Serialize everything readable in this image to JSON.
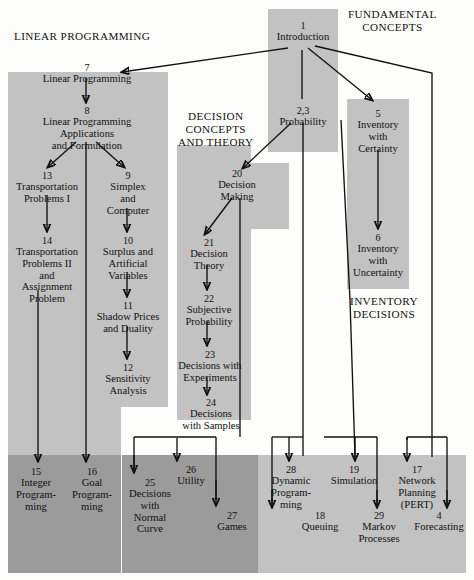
{
  "diagram": {
    "section_labels": [
      {
        "id": "linear-programming",
        "text": "LINEAR PROGRAMMING",
        "x": 14,
        "y": 30
      },
      {
        "id": "fundamental-concepts",
        "text": "FUNDAMENTAL\nCONCEPTS",
        "x": 348,
        "y": 8
      },
      {
        "id": "decision-concepts-and-theory",
        "text": "DECISION\nCONCEPTS\nAND THEORY",
        "x": 178,
        "y": 110
      },
      {
        "id": "inventory-decisions",
        "text": "INVENTORY\nDECISIONS",
        "x": 350,
        "y": 295
      }
    ],
    "panels": [
      {
        "id": "lp-panel-upper",
        "x": 8,
        "y": 72,
        "w": 160,
        "h": 335,
        "shade": "light"
      },
      {
        "id": "lp-panel-lower",
        "x": 8,
        "y": 407,
        "w": 113,
        "h": 48,
        "shade": "light"
      },
      {
        "id": "lp-panel-bottom",
        "x": 8,
        "y": 455,
        "w": 113,
        "h": 118,
        "shade": "dark"
      },
      {
        "id": "intro-panel",
        "x": 268,
        "y": 9,
        "w": 70,
        "h": 143,
        "shade": "light"
      },
      {
        "id": "inventory-panel",
        "x": 347,
        "y": 99,
        "w": 62,
        "h": 190,
        "shade": "light"
      },
      {
        "id": "decision-panel",
        "x": 177,
        "y": 145,
        "w": 74,
        "h": 275,
        "shade": "light"
      },
      {
        "id": "dm-panel-stub",
        "x": 251,
        "y": 163,
        "w": 38,
        "h": 66,
        "shade": "light"
      },
      {
        "id": "decision-bottom",
        "x": 122,
        "y": 455,
        "w": 136,
        "h": 118,
        "shade": "dark"
      },
      {
        "id": "models-bottom",
        "x": 258,
        "y": 455,
        "w": 208,
        "h": 118,
        "shade": "light"
      }
    ],
    "nodes": [
      {
        "id": "ch1",
        "num": "1",
        "title": "Introduction",
        "x": 268,
        "y": 20,
        "w": 70
      },
      {
        "id": "ch23",
        "num": "2,3",
        "title": "Probability",
        "x": 263,
        "y": 105,
        "w": 80
      },
      {
        "id": "ch5",
        "num": "5",
        "title": "Inventory\nwith\nCertainty",
        "x": 347,
        "y": 108,
        "w": 62
      },
      {
        "id": "ch6",
        "num": "6",
        "title": "Inventory\nwith\nUncertainty",
        "x": 343,
        "y": 232,
        "w": 70
      },
      {
        "id": "ch7",
        "num": "7",
        "title": "Linear Programming",
        "x": 12,
        "y": 62,
        "w": 150
      },
      {
        "id": "ch8",
        "num": "8",
        "title": "Linear Programming\nApplications\nand Formulation",
        "x": 12,
        "y": 105,
        "w": 150
      },
      {
        "id": "ch13",
        "num": "13",
        "title": "Transportation\nProblems I",
        "x": 8,
        "y": 170,
        "w": 78
      },
      {
        "id": "ch9",
        "num": "9",
        "title": "Simplex\nand\nComputer",
        "x": 92,
        "y": 170,
        "w": 72
      },
      {
        "id": "ch14",
        "num": "14",
        "title": "Transportation\nProblems II\nand\nAssignment\nProblem",
        "x": 8,
        "y": 235,
        "w": 78
      },
      {
        "id": "ch10",
        "num": "10",
        "title": "Surplus and\nArtificial\nVariables",
        "x": 92,
        "y": 235,
        "w": 72
      },
      {
        "id": "ch11",
        "num": "11",
        "title": "Shadow Prices\nand Duality",
        "x": 88,
        "y": 300,
        "w": 80
      },
      {
        "id": "ch12",
        "num": "12",
        "title": "Sensitivity\nAnalysis",
        "x": 92,
        "y": 362,
        "w": 72
      },
      {
        "id": "ch20",
        "num": "20",
        "title": "Decision\nMaking",
        "x": 206,
        "y": 168,
        "w": 62
      },
      {
        "id": "ch21",
        "num": "21",
        "title": "Decision\nTheory",
        "x": 178,
        "y": 237,
        "w": 62
      },
      {
        "id": "ch22",
        "num": "22",
        "title": "Subjective\nProbability",
        "x": 172,
        "y": 293,
        "w": 74
      },
      {
        "id": "ch23b",
        "num": "23",
        "title": "Decisions with\nExperiments",
        "x": 168,
        "y": 349,
        "w": 84
      },
      {
        "id": "ch24",
        "num": "24",
        "title": "Decisions\nwith Samples",
        "x": 172,
        "y": 397,
        "w": 78
      },
      {
        "id": "ch15",
        "num": "15",
        "title": "Integer\nProgram-\nming",
        "x": 8,
        "y": 466,
        "w": 56
      },
      {
        "id": "ch16",
        "num": "16",
        "title": "Goal\nProgram-\nming",
        "x": 64,
        "y": 466,
        "w": 56
      },
      {
        "id": "ch25",
        "num": "25",
        "title": "Decisions\nwith\nNormal\nCurve",
        "x": 122,
        "y": 477,
        "w": 56
      },
      {
        "id": "ch26",
        "num": "26",
        "title": "Utility",
        "x": 160,
        "y": 464,
        "w": 62
      },
      {
        "id": "ch27",
        "num": "27",
        "title": "Games",
        "x": 206,
        "y": 510,
        "w": 52
      },
      {
        "id": "ch28",
        "num": "28",
        "title": "Dynamic\nProgram-\nming",
        "x": 262,
        "y": 464,
        "w": 58
      },
      {
        "id": "ch18",
        "num": "18",
        "title": "Queuing",
        "x": 292,
        "y": 510,
        "w": 56
      },
      {
        "id": "ch19",
        "num": "19",
        "title": "Simulation",
        "x": 320,
        "y": 464,
        "w": 68
      },
      {
        "id": "ch29",
        "num": "29",
        "title": "Markov\nProcesses",
        "x": 348,
        "y": 510,
        "w": 62
      },
      {
        "id": "ch17",
        "num": "17",
        "title": "Network\nPlanning\n(PERT)",
        "x": 388,
        "y": 464,
        "w": 58
      },
      {
        "id": "ch4",
        "num": "4",
        "title": "Forecasting",
        "x": 406,
        "y": 510,
        "w": 66
      }
    ],
    "colors": {
      "panel_light": "#c2c2c2",
      "panel_dark": "#9b9b9b",
      "background": "#fdfdfb",
      "ink": "#111111"
    }
  }
}
